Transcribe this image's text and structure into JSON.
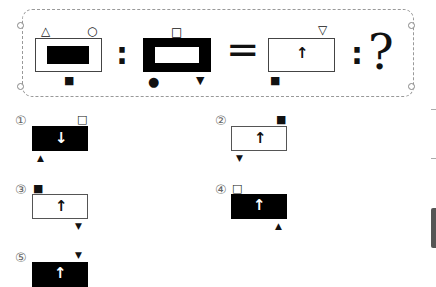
{
  "puzzle": {
    "type": "analogy",
    "question_mark": "?",
    "colon": ":",
    "equals": "=",
    "term1": {
      "frame": "white",
      "inner": "black-rect",
      "symbols": {
        "top_left": "△",
        "top_right": "○",
        "bottom_center": "■"
      }
    },
    "term2": {
      "frame": "black-thick",
      "inner": "white-rect",
      "symbols": {
        "top_center": "□",
        "bottom_left": "●",
        "bottom_right": "▼"
      }
    },
    "term3": {
      "frame": "white",
      "arrow": "↑",
      "symbols": {
        "top_right": "▽",
        "bottom_left": "■"
      }
    }
  },
  "options": [
    {
      "number": "①",
      "fill": "black",
      "arrow": "↓",
      "top_symbol": "□",
      "top_pos": "right",
      "bottom_symbol": "▲",
      "bottom_pos": "left"
    },
    {
      "number": "②",
      "fill": "white",
      "arrow": "↑",
      "top_symbol": "■",
      "top_pos": "right",
      "bottom_symbol": "▼",
      "bottom_pos": "left"
    },
    {
      "number": "③",
      "fill": "white",
      "arrow": "↑",
      "top_symbol": "■",
      "top_pos": "left",
      "bottom_symbol": "▼",
      "bottom_pos": "right"
    },
    {
      "number": "④",
      "fill": "black",
      "arrow": "↑",
      "top_symbol": "□",
      "top_pos": "left",
      "bottom_symbol": "▲",
      "bottom_pos": "right"
    },
    {
      "number": "⑤",
      "fill": "black",
      "arrow": "↑",
      "top_symbol": "▼",
      "top_pos": "right",
      "bottom_symbol": "",
      "bottom_pos": ""
    }
  ]
}
